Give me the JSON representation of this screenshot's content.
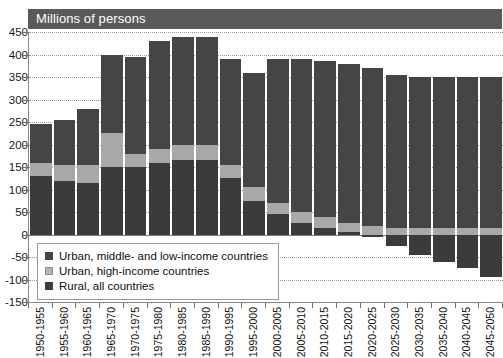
{
  "cut_title": "",
  "header": {
    "label": "Millions of persons"
  },
  "axis": {
    "y_ticks": [
      450,
      400,
      350,
      300,
      250,
      200,
      150,
      100,
      50,
      0,
      -50,
      -100,
      -150
    ],
    "y_min": -150,
    "y_max": 450
  },
  "legend": {
    "items": [
      {
        "key": "urban-ml",
        "label": "Urban, middle- and low-income countries",
        "color": "#454545"
      },
      {
        "key": "urban-hi",
        "label": "Urban, high-income countries",
        "color": "#b4b4b4"
      },
      {
        "key": "rural",
        "label": "Rural, all countries",
        "color": "#3b3b3b"
      }
    ]
  },
  "chart_data": {
    "type": "bar",
    "title": "Millions of persons",
    "xlabel": "",
    "ylabel": "Millions of persons",
    "ylim": [
      -150,
      450
    ],
    "grid": true,
    "stacked": true,
    "legend_position": "inside-bottom-left",
    "categories": [
      "1950-1955",
      "1955-1960",
      "1960-1965",
      "1965-1970",
      "1970-1975",
      "1975-1980",
      "1980-1985",
      "1985-1990",
      "1990-1995",
      "1995-2000",
      "2000-2005",
      "2005-2010",
      "2010-2015",
      "2015-2020",
      "2020-2025",
      "2025-2030",
      "2030-2035",
      "2035-2040",
      "2040-2045",
      "2045-2050"
    ],
    "series": [
      {
        "name": "Rural, all countries",
        "color": "#3b3b3b",
        "values": [
          130,
          120,
          115,
          150,
          150,
          160,
          165,
          165,
          125,
          75,
          45,
          25,
          15,
          5,
          -5,
          -25,
          -45,
          -60,
          -75,
          -95
        ]
      },
      {
        "name": "Urban, high-income countries",
        "color": "#b4b4b4",
        "values": [
          30,
          35,
          40,
          75,
          30,
          30,
          35,
          35,
          30,
          30,
          25,
          25,
          25,
          20,
          20,
          15,
          15,
          15,
          15,
          15
        ]
      },
      {
        "name": "Urban, middle- and low-income countries",
        "color": "#454545",
        "values": [
          85,
          100,
          125,
          175,
          215,
          240,
          240,
          240,
          235,
          255,
          320,
          340,
          345,
          355,
          350,
          340,
          335,
          335,
          335,
          335
        ]
      }
    ],
    "totals_positive": [
      245,
      255,
      280,
      400,
      395,
      430,
      440,
      440,
      390,
      360,
      390,
      390,
      385,
      380,
      370,
      355,
      350,
      350,
      350,
      350
    ]
  }
}
